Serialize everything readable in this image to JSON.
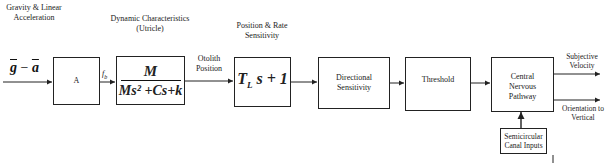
{
  "diagram": {
    "type": "block-diagram",
    "title": "",
    "input": {
      "top_label": "Gravity & Linear Acceleration",
      "signal": {
        "g": "g",
        "minus": " − ",
        "a": "a"
      }
    },
    "blocks": [
      {
        "id": "A",
        "label": "A",
        "top_label": ""
      },
      {
        "id": "dynamic",
        "top_label": "Dynamic Characteristics (Utricle)",
        "numerator": "M",
        "denominator": "Ms² +Cs+k"
      },
      {
        "id": "position_rate",
        "top_label": "Position & Rate Sensitivity",
        "tf_T": "T",
        "tf_sub": "L",
        "tf_rest": "s + 1"
      },
      {
        "id": "directional",
        "label": "Directional Sensitivity"
      },
      {
        "id": "threshold",
        "label": "Threshold"
      },
      {
        "id": "cns",
        "label": "Central Nervous Pathway"
      },
      {
        "id": "semicircular",
        "label": "Semicircular Canal Inputs"
      }
    ],
    "edge_labels": {
      "fb": "f",
      "fb_sub": "b",
      "otolith": "Otolith Position"
    },
    "outputs": [
      {
        "label": "Subjective Velocity"
      },
      {
        "label": "Orientation to Vertical"
      }
    ],
    "colors": {
      "line": "#222222",
      "background": "#ffffff"
    }
  }
}
